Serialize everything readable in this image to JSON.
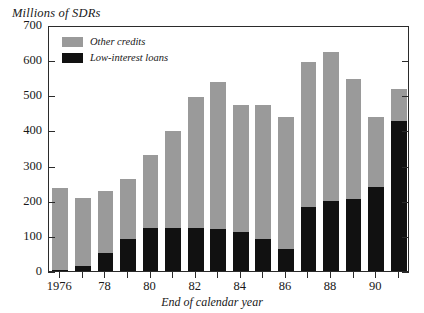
{
  "chart_data": {
    "type": "bar",
    "stacked": true,
    "title": "",
    "ylabel": "Millions of SDRs",
    "xlabel": "End of calendar year",
    "ylim": [
      0,
      700
    ],
    "yticks": [
      0,
      100,
      200,
      300,
      400,
      500,
      600,
      700
    ],
    "ytick_labels": [
      "0",
      "100",
      "200",
      "300",
      "400",
      "500",
      "600",
      "700"
    ],
    "grid": false,
    "legend_position": "top-left-inside",
    "categories": [
      1976,
      1977,
      1978,
      1979,
      1980,
      1981,
      1982,
      1983,
      1984,
      1985,
      1986,
      1987,
      1988,
      1989,
      1990,
      1991
    ],
    "xtick_labels": [
      "1976",
      "",
      "78",
      "",
      "80",
      "",
      "82",
      "",
      "84",
      "",
      "86",
      "",
      "88",
      "",
      "90",
      ""
    ],
    "series": [
      {
        "name": "Low-interest loans",
        "color": "#111111",
        "values": [
          2,
          13,
          52,
          92,
          122,
          122,
          122,
          120,
          110,
          90,
          64,
          183,
          200,
          205,
          240,
          428
        ]
      },
      {
        "name": "Other credits",
        "color": "#9a9a9a",
        "values": [
          235,
          195,
          176,
          170,
          208,
          276,
          373,
          418,
          362,
          381,
          374,
          412,
          423,
          340,
          197,
          90
        ]
      }
    ],
    "totals": [
      237,
      208,
      228,
      262,
      330,
      398,
      495,
      538,
      472,
      471,
      438,
      595,
      623,
      545,
      437,
      518
    ]
  },
  "legend": {
    "items": [
      {
        "label": "Other credits",
        "color": "#9a9a9a"
      },
      {
        "label": "Low-interest loans",
        "color": "#111111"
      }
    ]
  }
}
